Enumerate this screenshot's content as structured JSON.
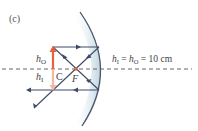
{
  "panel_label": "(c)",
  "labels": {
    "object_height": "h",
    "object_height_sub": "O",
    "image_height": "h",
    "image_height_sub": "I",
    "center": "C",
    "focus": "F",
    "equation_h1": "h",
    "equation_h1_sub": "I",
    "equation_eq1": " = ",
    "equation_h2": "h",
    "equation_h2_sub": "O",
    "equation_rest": " = 10 cm"
  },
  "colors": {
    "ray": "#3d4a66",
    "object_arrow": "#e8603c",
    "image_arrow": "#f2b8a0",
    "mirror_edge": "#4a5568",
    "mirror_shade": "#c9dbe6",
    "axis": "#555555",
    "focus_dot": "#e8603c"
  }
}
